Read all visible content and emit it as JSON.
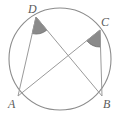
{
  "figure": {
    "kind": "circle-geometry-diagram",
    "canvas": {
      "width": 124,
      "height": 125,
      "background": "#ffffff"
    },
    "circle": {
      "name": "circumscribed-circle",
      "center_x": 60,
      "center_y": 59,
      "radius": 51,
      "stroke": "#8c8c8c",
      "stroke_width": 1.1,
      "fill": "none"
    },
    "points": [
      {
        "id": "A",
        "label": "A",
        "x": 18,
        "y": 96,
        "label_x": 8,
        "label_y": 98
      },
      {
        "id": "B",
        "label": "B",
        "x": 102,
        "y": 96,
        "label_x": 103,
        "label_y": 98
      },
      {
        "id": "C",
        "label": "C",
        "x": 100,
        "y": 30,
        "label_x": 101,
        "label_y": 16
      },
      {
        "id": "D",
        "label": "D",
        "x": 36,
        "y": 17,
        "label_x": 28,
        "label_y": 3
      }
    ],
    "chords": [
      {
        "name": "chord-DA",
        "from": "D",
        "to": "A",
        "stroke": "#9a9a9a",
        "stroke_width": 1
      },
      {
        "name": "chord-DB",
        "from": "D",
        "to": "B",
        "stroke": "#9a9a9a",
        "stroke_width": 1
      },
      {
        "name": "chord-CA",
        "from": "C",
        "to": "A",
        "stroke": "#9a9a9a",
        "stroke_width": 1
      },
      {
        "name": "chord-CB",
        "from": "C",
        "to": "B",
        "stroke": "#9a9a9a",
        "stroke_width": 1
      }
    ],
    "angle_marks": [
      {
        "name": "angle-ADB-wedge",
        "vertex": "D",
        "rays": [
          "A",
          "B"
        ],
        "radius": 17,
        "fill": "#8a8a8a",
        "stroke": "#6f6f6f"
      },
      {
        "name": "angle-ACB-wedge",
        "vertex": "C",
        "rays": [
          "A",
          "B"
        ],
        "radius": 17,
        "fill": "#8a8a8a",
        "stroke": "#6f6f6f"
      }
    ],
    "colors": {
      "circle_stroke": "#8c8c8c",
      "chord_stroke": "#9a9a9a",
      "wedge_fill": "#8a8a8a",
      "label_text": "#5b5b5b",
      "background": "#ffffff"
    }
  }
}
